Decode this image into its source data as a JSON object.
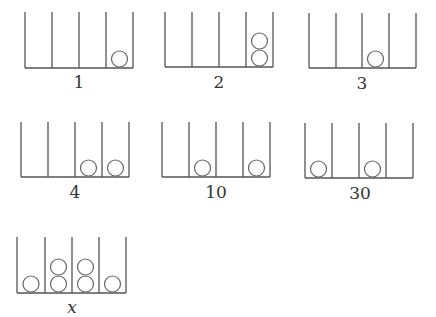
{
  "diagram": {
    "rods_per_frame": 4,
    "frames": [
      {
        "label": "1",
        "x": [
          25,
          52,
          79,
          106,
          133
        ],
        "top": 12,
        "bottom": 68,
        "beads": [
          0,
          0,
          0,
          1
        ]
      },
      {
        "label": "2",
        "x": [
          165,
          192,
          219,
          246,
          273
        ],
        "top": 12,
        "bottom": 67,
        "beads": [
          0,
          0,
          0,
          2
        ]
      },
      {
        "label": "3",
        "x": [
          309,
          336,
          362,
          389,
          416
        ],
        "top": 13,
        "bottom": 68,
        "beads": [
          0,
          0,
          1,
          0
        ]
      },
      {
        "label": "4",
        "x": [
          21,
          48,
          75,
          102,
          129
        ],
        "top": 122,
        "bottom": 177,
        "beads": [
          0,
          0,
          1,
          1
        ]
      },
      {
        "label": "10",
        "x": [
          162,
          189,
          216,
          243,
          270
        ],
        "top": 122,
        "bottom": 177,
        "beads": [
          0,
          1,
          0,
          1
        ]
      },
      {
        "label": "30",
        "x": [
          305,
          332,
          359,
          386,
          413
        ],
        "top": 123,
        "bottom": 178,
        "beads": [
          1,
          0,
          1,
          0
        ]
      },
      {
        "label": "x",
        "x": [
          17,
          45,
          72,
          99,
          126
        ],
        "top": 237,
        "bottom": 293,
        "beads": [
          1,
          2,
          2,
          1
        ],
        "italic": true
      }
    ]
  },
  "labels": {
    "f1": "1",
    "f2": "2",
    "f3": "3",
    "f4": "4",
    "f5": "10",
    "f6": "30",
    "f7": "x"
  }
}
